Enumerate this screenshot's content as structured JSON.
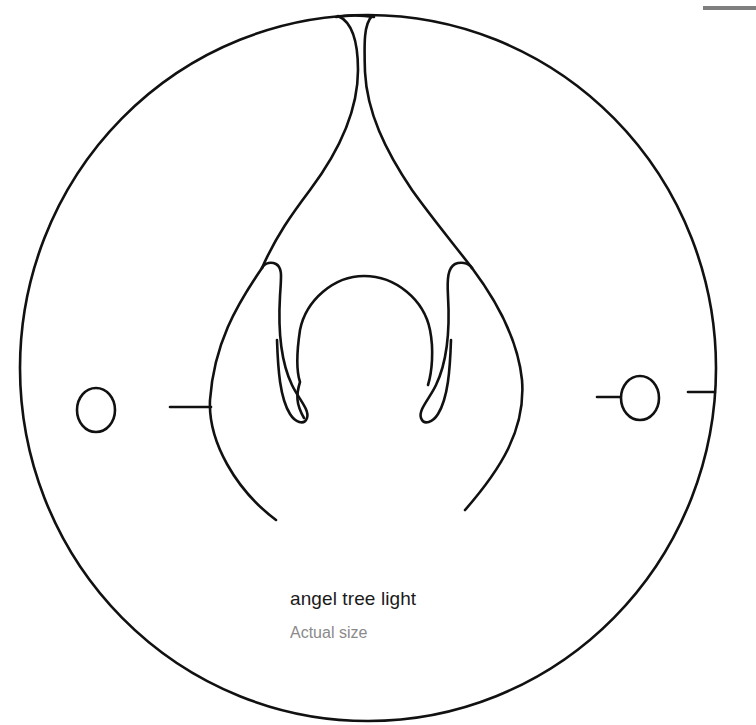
{
  "template": {
    "title": "angel tree light",
    "subtitle": "Actual size",
    "colors": {
      "outline": "#111111",
      "title_text": "#1a1a1a",
      "subtitle_text": "#8a8a8a",
      "corner_bar": "#7f7f7f",
      "background": "#ffffff"
    },
    "parts": [
      "outer-circle",
      "angel-neck",
      "angel-arms",
      "angel-head-arch",
      "angel-body-curves",
      "left-hanging-hole",
      "right-hanging-hole",
      "left-tab-slot",
      "right-tab-slots"
    ]
  }
}
